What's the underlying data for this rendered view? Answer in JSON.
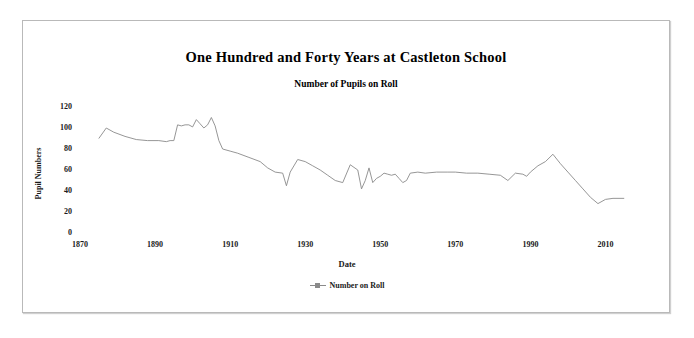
{
  "chart_data": {
    "type": "line",
    "title": "One Hundred and Forty Years at Castleton School",
    "subtitle": "Number of Pupils on Roll",
    "xlabel": "Date",
    "ylabel": "Pupil Numbers",
    "xlim": [
      1870,
      2020
    ],
    "ylim": [
      0,
      120
    ],
    "xticks": [
      1870,
      1890,
      1910,
      1930,
      1950,
      1970,
      1990,
      2010
    ],
    "yticks": [
      0,
      20,
      40,
      60,
      80,
      100,
      120
    ],
    "grid": false,
    "legend_position": "bottom",
    "series_color": "#8a8a8a",
    "marker": "square",
    "series": [
      {
        "name": "Number on Roll",
        "x": [
          1875,
          1877,
          1879,
          1882,
          1885,
          1888,
          1891,
          1893,
          1894,
          1895,
          1896,
          1897,
          1898,
          1899,
          1900,
          1901,
          1902,
          1903,
          1904,
          1905,
          1906,
          1907,
          1908,
          1910,
          1912,
          1915,
          1918,
          1920,
          1922,
          1924,
          1925,
          1926,
          1928,
          1930,
          1932,
          1934,
          1936,
          1938,
          1940,
          1942,
          1944,
          1945,
          1946,
          1947,
          1948,
          1949,
          1950,
          1951,
          1952,
          1953,
          1954,
          1955,
          1956,
          1957,
          1958,
          1960,
          1962,
          1965,
          1968,
          1970,
          1973,
          1976,
          1979,
          1982,
          1984,
          1986,
          1988,
          1989,
          1990,
          1992,
          1994,
          1996,
          1998,
          2000,
          2002,
          2004,
          2006,
          2008,
          2010,
          2012,
          2015
        ],
        "values": [
          90,
          100,
          96,
          92,
          89,
          88,
          88,
          87,
          88,
          88,
          103,
          102,
          103,
          103,
          101,
          108,
          104,
          100,
          103,
          110,
          102,
          88,
          80,
          78,
          76,
          72,
          68,
          62,
          58,
          57,
          45,
          58,
          70,
          68,
          64,
          60,
          55,
          50,
          48,
          65,
          60,
          42,
          50,
          62,
          48,
          52,
          54,
          57,
          56,
          55,
          56,
          52,
          48,
          50,
          57,
          58,
          57,
          58,
          58,
          58,
          57,
          57,
          56,
          55,
          50,
          57,
          56,
          54,
          58,
          64,
          68,
          75,
          66,
          58,
          50,
          42,
          34,
          28,
          32,
          33,
          33
        ]
      }
    ]
  },
  "legend": {
    "items": [
      {
        "label": "Number on Roll"
      }
    ]
  }
}
